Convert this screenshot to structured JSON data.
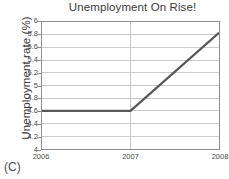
{
  "chart_data": {
    "type": "line",
    "title": "Unemployment On Rise!",
    "xlabel": "",
    "ylabel": "Unemployment rate (%)",
    "x": [
      "2006",
      "2007",
      "2008"
    ],
    "values": [
      4.6,
      4.6,
      5.83
    ],
    "series": [
      {
        "name": "Unemployment rate",
        "values": [
          4.6,
          4.6,
          5.83
        ],
        "color": "#595959"
      }
    ],
    "xlim": [
      2006,
      2008
    ],
    "ylim": [
      4,
      6
    ],
    "xticks": [
      "2006",
      "2007",
      "2008"
    ],
    "yticks": [
      "4",
      "4.2",
      "4.4",
      "4.6",
      "4.8",
      "5",
      "5.2",
      "5.4",
      "5.6",
      "5.8",
      "6"
    ],
    "ytick_values": [
      4,
      4.2,
      4.4,
      4.6,
      4.8,
      5,
      5.2,
      5.4,
      5.6,
      5.8,
      6
    ],
    "grid": "horizontal-and-vertical",
    "grid_color": "#c9c9c9",
    "legend": "none",
    "caption": "(C)",
    "annotations": []
  },
  "figure": {
    "caption": "(C)"
  }
}
